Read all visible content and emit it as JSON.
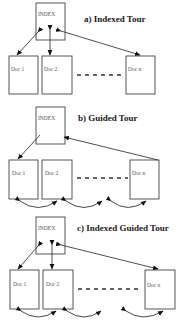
{
  "panels": [
    {
      "title": "a) Indexed Tour",
      "index_label": "INDEX",
      "docs": [
        "Doc 1",
        "Doc 2",
        "Doc n"
      ]
    },
    {
      "title": "b) Guided Tour",
      "index_label": "INDEX",
      "docs": [
        "Doc 1",
        "Doc 2",
        "Doc n"
      ]
    },
    {
      "title": "c) Indexed Guided Tour",
      "index_label": "INDEX",
      "docs": [
        "Doc 1",
        "Doc 2",
        "Doc n"
      ]
    }
  ],
  "colors": {
    "stroke": "#444444",
    "text": "#1a1a1a",
    "background": "#ffffff"
  }
}
